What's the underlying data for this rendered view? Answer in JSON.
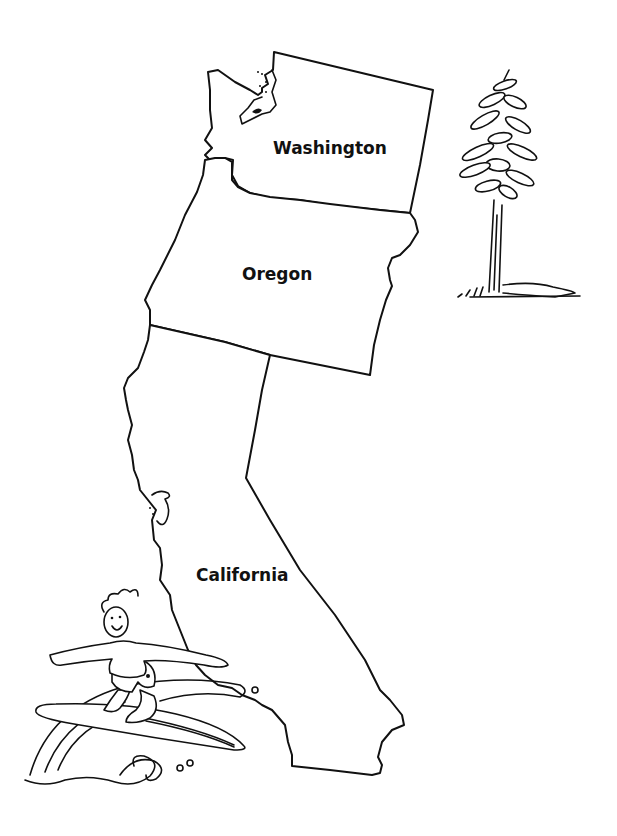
{
  "map": {
    "title": "",
    "style": "black-and-white outline coloring map",
    "colors": {
      "line": "#111111",
      "background": "#ffffff"
    },
    "states": [
      {
        "name": "Washington",
        "label": "Washington"
      },
      {
        "name": "Oregon",
        "label": "Oregon"
      },
      {
        "name": "California",
        "label": "California"
      }
    ],
    "illustrations": [
      {
        "name": "redwood-tree",
        "description": "tall conifer tree drawing"
      },
      {
        "name": "surfer",
        "description": "boy surfing a wave on a surfboard"
      }
    ]
  }
}
